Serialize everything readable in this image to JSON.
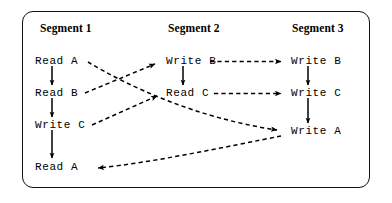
{
  "figure": {
    "frame": {
      "shape": "rounded-rectangle",
      "stroke_color": "#111111",
      "background_color": "#ffffff"
    }
  },
  "headers": [
    {
      "id": "segment-1",
      "label": "Segment 1",
      "x": 40,
      "y": 22
    },
    {
      "id": "segment-2",
      "label": "Segment 2",
      "x": 168,
      "y": 22
    },
    {
      "id": "segment-3",
      "label": "Segment 3",
      "x": 292,
      "y": 22
    }
  ],
  "columns": [
    {
      "id": "column-segment-1",
      "header": "Segment 1",
      "nodes": [
        {
          "id": "s1-read-a-1",
          "label": "Read A",
          "x": 35,
          "y": 59
        },
        {
          "id": "s1-read-b",
          "label": "Read B",
          "x": 35,
          "y": 91
        },
        {
          "id": "s1-write-c",
          "label": "Write C",
          "x": 35,
          "y": 123
        },
        {
          "id": "s1-read-a-2",
          "label": "Read A",
          "x": 35,
          "y": 164
        }
      ]
    },
    {
      "id": "column-segment-2",
      "header": "Segment 2",
      "nodes": [
        {
          "id": "s2-write-b",
          "label": "Write B",
          "x": 165,
          "y": 59
        },
        {
          "id": "s2-read-c",
          "label": "Read C",
          "x": 165,
          "y": 91
        }
      ]
    },
    {
      "id": "column-segment-3",
      "header": "Segment 3",
      "nodes": [
        {
          "id": "s3-write-b",
          "label": "Write B",
          "x": 290,
          "y": 59
        },
        {
          "id": "s3-write-c",
          "label": "Write C",
          "x": 290,
          "y": 91
        },
        {
          "id": "s3-write-a",
          "label": "Write A",
          "x": 290,
          "y": 129
        }
      ]
    }
  ],
  "edges": [
    {
      "id": "edge-s1-reada1-readb",
      "from": "s1-read-a-1",
      "to": "s1-read-b",
      "style": "solid",
      "direction": "down",
      "kind": "program-order"
    },
    {
      "id": "edge-s1-readb-writec",
      "from": "s1-read-b",
      "to": "s1-write-c",
      "style": "solid",
      "direction": "down",
      "kind": "program-order"
    },
    {
      "id": "edge-s1-writec-reada2",
      "from": "s1-write-c",
      "to": "s1-read-a-2",
      "style": "solid",
      "direction": "down",
      "kind": "program-order"
    },
    {
      "id": "edge-s2-writeb-readc",
      "from": "s2-write-b",
      "to": "s2-read-c",
      "style": "solid",
      "direction": "down",
      "kind": "program-order"
    },
    {
      "id": "edge-s3-writeb-writec",
      "from": "s3-write-b",
      "to": "s3-write-c",
      "style": "solid",
      "direction": "down",
      "kind": "program-order"
    },
    {
      "id": "edge-s3-writec-writea",
      "from": "s3-write-c",
      "to": "s3-write-a",
      "style": "solid",
      "direction": "down",
      "kind": "program-order"
    },
    {
      "id": "edge-s1-readb-to-s2-writeb",
      "from": "s1-read-b",
      "to": "s2-write-b",
      "style": "dashed",
      "direction": "up-right",
      "kind": "dependency"
    },
    {
      "id": "edge-s1-writec-to-s2-readc",
      "from": "s1-write-c",
      "to": "s2-read-c",
      "style": "dashed",
      "direction": "up-right",
      "kind": "dependency"
    },
    {
      "id": "edge-s1-reada1-to-s3-writea",
      "from": "s1-read-a-1",
      "to": "s3-write-a",
      "style": "dashed",
      "direction": "down-right",
      "kind": "dependency"
    },
    {
      "id": "edge-s2-writeb-to-s3-writeb",
      "from": "s2-write-b",
      "to": "s3-write-b",
      "style": "dashed",
      "direction": "right",
      "kind": "dependency"
    },
    {
      "id": "edge-s2-readc-to-s3-writec",
      "from": "s2-read-c",
      "to": "s3-write-c",
      "style": "dashed",
      "direction": "right",
      "kind": "dependency"
    },
    {
      "id": "edge-s3-writea-to-s1-reada2",
      "from": "s3-write-a",
      "to": "s1-read-a-2",
      "style": "dashed",
      "direction": "left",
      "kind": "dependency"
    }
  ],
  "legend": {
    "solid_meaning": "program order within a segment",
    "dashed_meaning": "cross-segment dependency"
  },
  "colors": {
    "ink": "#000000",
    "frame": "#111111",
    "paper": "#ffffff"
  }
}
